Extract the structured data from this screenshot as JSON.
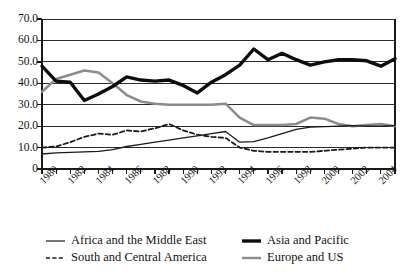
{
  "chart_data": {
    "type": "line",
    "title": "",
    "xlabel": "",
    "ylabel": "",
    "xlim": [
      1980,
      2005
    ],
    "ylim": [
      0,
      70
    ],
    "grid": true,
    "legend_position": "bottom",
    "ytick_labels": [
      "70.0",
      "60.0",
      "50.0",
      "40.0",
      "30.0",
      "20.0",
      "10.0",
      "0"
    ],
    "ytick_values": [
      70,
      60,
      50,
      40,
      30,
      20,
      10,
      0
    ],
    "xtick_labels": [
      "1980",
      "1982",
      "1984",
      "1986",
      "1988",
      "1990",
      "1992",
      "1994",
      "1996",
      "1998",
      "2000",
      "2002",
      "2004"
    ],
    "xtick_values": [
      1980,
      1982,
      1984,
      1986,
      1988,
      1990,
      1992,
      1994,
      1996,
      1998,
      2000,
      2002,
      2004
    ],
    "x": [
      1980,
      1981,
      1982,
      1983,
      1984,
      1985,
      1986,
      1987,
      1988,
      1989,
      1990,
      1991,
      1992,
      1993,
      1994,
      1995,
      1996,
      1997,
      1998,
      1999,
      2000,
      2001,
      2002,
      2003,
      2004,
      2005
    ],
    "series": [
      {
        "name": "Africa and the Middle East",
        "style": "thin-solid-black",
        "color": "#1a1a1a",
        "values": [
          7.0,
          7.5,
          7.8,
          8.0,
          8.2,
          9.0,
          10.5,
          11.5,
          12.5,
          13.5,
          14.5,
          15.5,
          16.5,
          17.5,
          12.5,
          12.8,
          14.5,
          16.5,
          18.5,
          19.5,
          19.8,
          20.0,
          20.2,
          20.0,
          20.0,
          20.2
        ]
      },
      {
        "name": "Asia and Pacific",
        "style": "thick-solid-black",
        "color": "#0d0d0d",
        "values": [
          48.0,
          41.0,
          40.5,
          32.0,
          35.0,
          38.5,
          43.0,
          41.5,
          41.0,
          41.5,
          39.0,
          35.5,
          40.5,
          44.0,
          48.5,
          56.0,
          51.0,
          54.0,
          51.0,
          48.5,
          50.0,
          51.0,
          51.0,
          50.5,
          48.0,
          51.5
        ]
      },
      {
        "name": "South and Central America",
        "style": "dashed-black",
        "color": "#1a1a1a",
        "values": [
          10.0,
          10.5,
          12.5,
          15.0,
          16.5,
          16.0,
          18.0,
          17.5,
          19.0,
          21.0,
          18.0,
          16.0,
          15.0,
          14.5,
          10.0,
          8.5,
          8.0,
          8.0,
          8.0,
          8.0,
          8.5,
          9.0,
          9.5,
          10.0,
          10.0,
          10.0
        ]
      },
      {
        "name": "Europe and US",
        "style": "medium-solid-gray",
        "color": "#8c8c8c",
        "values": [
          36.0,
          42.0,
          44.0,
          46.0,
          45.0,
          40.0,
          34.5,
          31.5,
          30.5,
          30.0,
          30.0,
          30.0,
          30.0,
          30.5,
          24.0,
          20.5,
          20.5,
          20.5,
          21.0,
          24.0,
          23.5,
          21.0,
          20.0,
          20.5,
          21.0,
          20.0
        ]
      }
    ]
  },
  "legend": {
    "entries": [
      {
        "label": "Africa and the Middle East",
        "marker": "thin-line-marker"
      },
      {
        "label": "Asia and Pacific",
        "marker": "thick-line-marker"
      },
      {
        "label": "South and Central America",
        "marker": "dashed-line-marker"
      },
      {
        "label": "Europe and US",
        "marker": "gray-line-marker"
      }
    ]
  }
}
